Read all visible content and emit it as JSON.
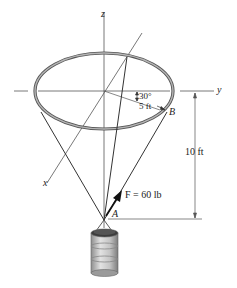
{
  "figure": {
    "type": "statics-3d-force-diagram",
    "axes": {
      "z_label": "z",
      "y_label": "y",
      "x_label": "x"
    },
    "labels": {
      "angle": "30°",
      "radius": "5 ft",
      "point_b": "B",
      "point_a": "A",
      "height": "10 ft",
      "force": "F = 60 lb"
    },
    "force": {
      "symbol": "F",
      "magnitude": 60,
      "unit": "lb"
    },
    "ring": {
      "radius_ft": 5,
      "angle_deg": 30
    },
    "height_ft": 10,
    "colors": {
      "line": "#333333",
      "ring": "#8a8a8a",
      "ring_dark": "#555555",
      "barrel": "#b8b8b8",
      "axis": "#555555"
    }
  }
}
